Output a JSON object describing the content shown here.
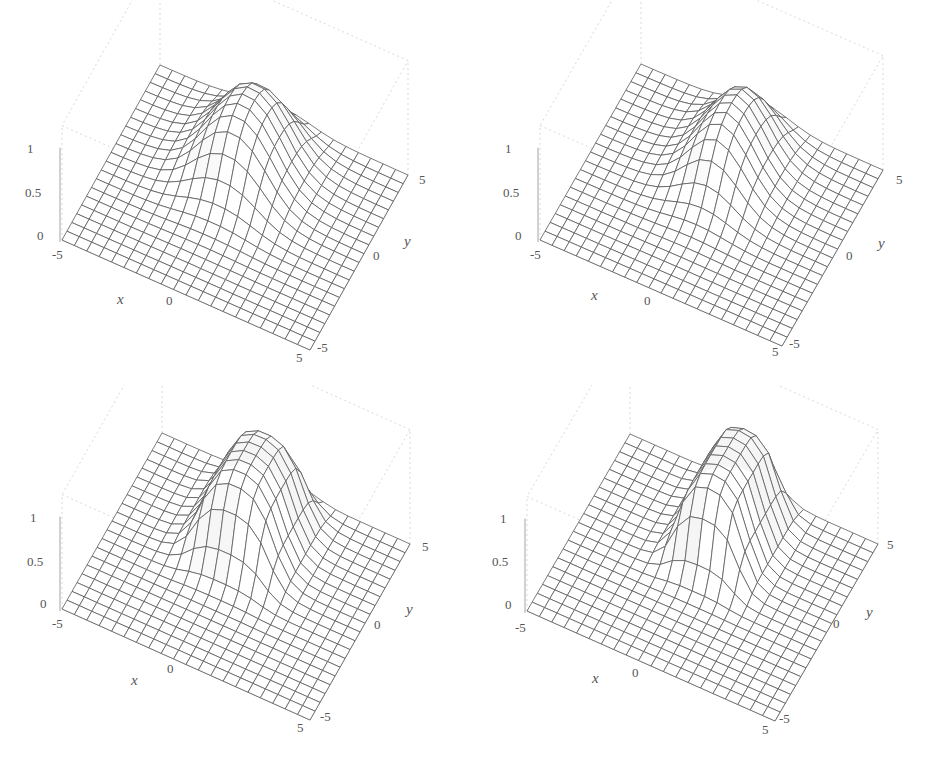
{
  "figure": {
    "panels": [
      {
        "id": "a",
        "x_label": "x",
        "y_label": "y",
        "z_ticks": [
          "0",
          "0.5",
          "1"
        ],
        "x_ticks": [
          "-5",
          "0",
          "5"
        ],
        "y_ticks": [
          "-5",
          "0",
          "5"
        ]
      },
      {
        "id": "b",
        "x_label": "x",
        "y_label": "y",
        "z_ticks": [
          "0",
          "0.5",
          "1"
        ],
        "x_ticks": [
          "-5",
          "0",
          "5"
        ],
        "y_ticks": [
          "-5",
          "0",
          "5"
        ]
      },
      {
        "id": "c",
        "x_label": "x",
        "y_label": "y",
        "z_ticks": [
          "0",
          "0.5",
          "1"
        ],
        "x_ticks": [
          "-5",
          "0",
          "5"
        ],
        "y_ticks": [
          "-5",
          "0",
          "5"
        ]
      },
      {
        "id": "d",
        "x_label": "x",
        "y_label": "y",
        "z_ticks": [
          "0",
          "0.5",
          "1"
        ],
        "x_ticks": [
          "-5",
          "0",
          "5"
        ],
        "y_ticks": [
          "-5",
          "0",
          "5"
        ]
      }
    ]
  },
  "chart_data": [
    {
      "type": "surface3d",
      "title": "",
      "xlabel": "x",
      "ylabel": "y",
      "zlabel": "",
      "xlim": [
        -5,
        5
      ],
      "ylim": [
        -5,
        5
      ],
      "zlim": [
        0,
        1
      ],
      "x_ticks": [
        -5,
        0,
        5
      ],
      "y_ticks": [
        -5,
        0,
        5
      ],
      "z_ticks": [
        0,
        0.5,
        1
      ],
      "grid_lines": 20,
      "surface": {
        "shape": "smooth plateau (wave packet)",
        "height": 1.0,
        "x_center": -0.3,
        "x_halfwidth": 1.4,
        "y_center": 1.9,
        "y_halfwidth": 2.2,
        "edge_sharpness": 0.9,
        "wavefront_ripple": "at mid-height of rising edge"
      },
      "color": "#555555"
    },
    {
      "type": "surface3d",
      "title": "",
      "xlabel": "x",
      "ylabel": "y",
      "zlabel": "",
      "xlim": [
        -5,
        5
      ],
      "ylim": [
        -5,
        5
      ],
      "zlim": [
        0,
        1
      ],
      "x_ticks": [
        -5,
        0,
        5
      ],
      "y_ticks": [
        -5,
        0,
        5
      ],
      "z_ticks": [
        0,
        0.5,
        1
      ],
      "grid_lines": 20,
      "surface": {
        "shape": "smooth plateau (wave packet)",
        "height": 1.0,
        "x_center": 0.0,
        "x_halfwidth": 1.1,
        "y_center": 2.0,
        "y_halfwidth": 2.3,
        "edge_sharpness": 0.9,
        "wavefront_ripple": "at back edge"
      },
      "color": "#555555"
    },
    {
      "type": "surface3d",
      "title": "",
      "xlabel": "x",
      "ylabel": "y",
      "zlabel": "",
      "xlim": [
        -5,
        5
      ],
      "ylim": [
        -5,
        5
      ],
      "zlim": [
        0,
        1
      ],
      "x_ticks": [
        -5,
        0,
        5
      ],
      "y_ticks": [
        -5,
        0,
        5
      ],
      "z_ticks": [
        0,
        0.5,
        1
      ],
      "grid_lines": 20,
      "surface": {
        "shape": "steep plateau (wave packet)",
        "height": 1.0,
        "x_center": -0.2,
        "x_halfwidth": 1.5,
        "y_center": 2.0,
        "y_halfwidth": 2.3,
        "edge_sharpness": 0.55,
        "wavefront_ripple": "at mid-height of rising edge"
      },
      "color": "#555555"
    },
    {
      "type": "surface3d",
      "title": "",
      "xlabel": "x",
      "ylabel": "y",
      "zlabel": "",
      "xlim": [
        -5,
        5
      ],
      "ylim": [
        -5,
        5
      ],
      "zlim": [
        0,
        1
      ],
      "x_ticks": [
        -5,
        0,
        5
      ],
      "y_ticks": [
        -5,
        0,
        5
      ],
      "z_ticks": [
        0,
        0.5,
        1
      ],
      "grid_lines": 20,
      "surface": {
        "shape": "steep plateau (wave packet)",
        "height": 1.0,
        "x_center": 0.1,
        "x_halfwidth": 1.3,
        "y_center": 2.2,
        "y_halfwidth": 2.4,
        "edge_sharpness": 0.45,
        "wavefront_ripple": "at back edge"
      },
      "color": "#555555"
    }
  ]
}
